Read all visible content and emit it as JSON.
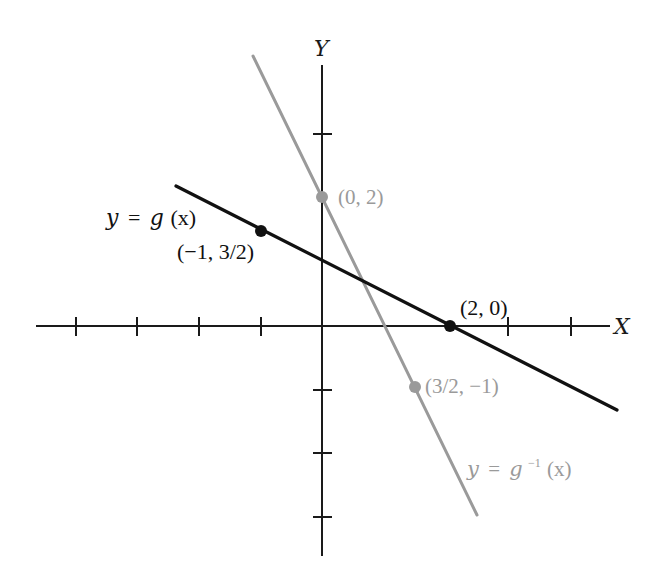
{
  "figure": {
    "type": "function-inverse-graph",
    "axes": {
      "x_label": "X",
      "y_label": "Y",
      "x_ticks": [
        -4,
        -3,
        -2,
        -1,
        1,
        2,
        3,
        4
      ],
      "y_ticks": [
        3,
        2,
        1,
        -1,
        -2,
        -3
      ],
      "axis_color": "#1a1a1a"
    },
    "curves": [
      {
        "name": "g",
        "label": "y = g(x)",
        "label_parts": {
          "lhs": "y",
          "eq": "=",
          "fn": "g",
          "arg": "(x)"
        },
        "equation": "y = -3/4 x + 3/2",
        "color": "#111111",
        "points": [
          {
            "label": "(−1, 3/2)",
            "x": -1,
            "y": 1.5
          },
          {
            "label": "(2, 0)",
            "x": 2,
            "y": 0
          }
        ]
      },
      {
        "name": "g_inverse",
        "label": "y = g⁻¹(x)",
        "label_parts": {
          "lhs": "y",
          "eq": "=",
          "fn": "g",
          "sup": "−1",
          "arg": "(x)"
        },
        "equation": "y = -4/3 x + 2",
        "color": "#9a9a9a",
        "points": [
          {
            "label": "(0, 2)",
            "x": 0,
            "y": 2
          },
          {
            "label": "(3/2, −1)",
            "x": 1.5,
            "y": -1
          }
        ]
      }
    ]
  }
}
